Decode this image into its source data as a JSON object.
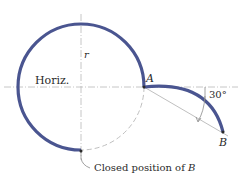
{
  "diagram": {
    "labels": {
      "horizontal": "Horiz.",
      "radius": "r",
      "point_a": "A",
      "point_b": "B",
      "angle": "30°",
      "closed_position": "Closed position of ",
      "closed_position_point": "B"
    },
    "geometry": {
      "circle_center": [
        81,
        87
      ],
      "radius_px": 63,
      "angle_deg": 30
    },
    "colors": {
      "curve": "#4a5590",
      "construction": "#b8b8b8",
      "text": "#2a2a2a"
    }
  }
}
